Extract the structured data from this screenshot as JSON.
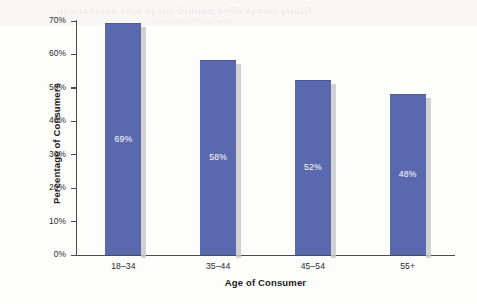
{
  "chart_data": {
    "type": "bar",
    "title": "",
    "subtitle": "",
    "categories": [
      "18–34",
      "35–44",
      "45–54",
      "55+"
    ],
    "values": [
      69,
      58,
      52,
      48
    ],
    "data_labels": [
      "69%",
      "58%",
      "52%",
      "48%"
    ],
    "xlabel": "Age of Consumer",
    "ylabel": "Percentage of Consumers",
    "ylim": [
      0,
      70
    ],
    "ytick_values": [
      70,
      60,
      50,
      40,
      30,
      20,
      10,
      0
    ],
    "ytick_labels": [
      "70%",
      "60%",
      "50%",
      "40%",
      "30%",
      "20%",
      "10%",
      "0%"
    ],
    "grid": false,
    "legend": false,
    "legend_position": "none",
    "bar_color": "#5a68ad",
    "bar_shadow_color": "#c9c9c9",
    "axis_color": "#4c4c4c",
    "data_label_color": "#ffffff",
    "background_color": "#fdfdfc"
  },
  "artifacts": {
    "bleed_through_line_1": "the reverse side of the printed page shows faintly",
    "bleed_through_line_2": "mirrored heading text"
  }
}
